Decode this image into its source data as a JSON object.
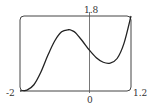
{
  "chart_data": {
    "type": "line",
    "title": "",
    "xlabel": "",
    "ylabel": "",
    "xlim": [
      -2,
      1.2
    ],
    "ylim": [
      0,
      1.8
    ],
    "grid": false,
    "legend": null,
    "tick_labels": {
      "x_left": "-2",
      "x_right": "1.2",
      "x_origin": "0",
      "y_top": "1.8"
    },
    "series": [
      {
        "name": "f(x)",
        "x": [
          -2.0,
          -1.8,
          -1.6,
          -1.4,
          -1.2,
          -1.0,
          -0.8,
          -0.6,
          -0.5,
          -0.4,
          -0.2,
          0.0,
          0.2,
          0.4,
          0.6,
          0.8,
          1.0,
          1.2
        ],
        "y": [
          0.0,
          0.02,
          0.15,
          0.45,
          0.85,
          1.2,
          1.42,
          1.47,
          1.45,
          1.4,
          1.2,
          0.98,
          0.8,
          0.69,
          0.67,
          0.78,
          1.15,
          1.8
        ]
      }
    ]
  },
  "labels": {
    "x_left": "-2",
    "x_right": "1.2",
    "x_origin": "0",
    "y_top": "1.8"
  },
  "colors": {
    "curve": "#222222",
    "frame": "#444444",
    "axis": "#555555"
  }
}
